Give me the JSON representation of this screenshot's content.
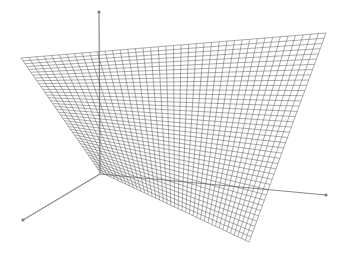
{
  "figure": {
    "background": "#ffffff",
    "mesh_color": "#5a5a5a",
    "axis_color": "#8a8a8a"
  },
  "axes": {
    "origin": [
      100,
      174
    ],
    "z_axis_end": [
      99,
      12
    ],
    "x_axis_end": [
      23,
      220
    ],
    "y_axis_end": [
      326,
      195
    ]
  },
  "surface": {
    "type": "bilinear-ruled-saddle",
    "corners": {
      "far_left": [
        21,
        58
      ],
      "far_right": [
        326,
        33
      ],
      "near_right": [
        249,
        242
      ],
      "near_left": [
        100,
        172
      ]
    },
    "divisions": 40
  }
}
